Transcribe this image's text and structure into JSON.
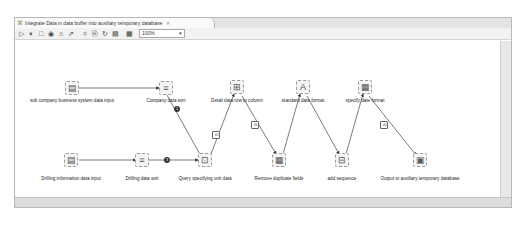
{
  "editor": {
    "tab_title": "Integrate Data in  data buffer into auxiliary temporary database",
    "tab_icon": "job-icon",
    "tab_close": "✕"
  },
  "toolbar": {
    "buttons": [
      {
        "name": "run-icon",
        "glyph": "▷"
      },
      {
        "name": "pause-icon",
        "glyph": "⏸"
      },
      {
        "name": "stop-icon",
        "glyph": "□"
      },
      {
        "name": "preview-icon",
        "glyph": "◉"
      },
      {
        "name": "lock-icon",
        "glyph": "⌂"
      },
      {
        "name": "export-icon",
        "glyph": "⇗"
      },
      {
        "name": "align-icon",
        "glyph": "⌗"
      },
      {
        "name": "copy-icon",
        "glyph": "⎘"
      },
      {
        "name": "refresh-icon",
        "glyph": "↻"
      },
      {
        "name": "layout-icon",
        "glyph": "▤"
      },
      {
        "name": "grid-icon",
        "glyph": "▦"
      }
    ],
    "zoom_value": "100%"
  },
  "nodes": [
    {
      "id": "n1",
      "label": "sub company business system data  input",
      "glyph": "▤"
    },
    {
      "id": "n2",
      "label": "Company data sort",
      "glyph": "≡"
    },
    {
      "id": "n3",
      "label": "Detail data row to column",
      "glyph": "⊞"
    },
    {
      "id": "n4",
      "label": "standard data format",
      "glyph": "A"
    },
    {
      "id": "n5",
      "label": "specify date format",
      "glyph": "▦"
    },
    {
      "id": "n6",
      "label": "Drilling information data input",
      "glyph": "▤"
    },
    {
      "id": "n7",
      "label": "Drilling data sort",
      "glyph": "≡"
    },
    {
      "id": "n8",
      "label": "Query specifying unit data",
      "glyph": "⊡"
    },
    {
      "id": "n9",
      "label": "Remove duplicate fields",
      "glyph": "▦"
    },
    {
      "id": "n10",
      "label": "add sequence",
      "glyph": "⊟"
    },
    {
      "id": "n11",
      "label": "Output to auxiliary temporary database",
      "glyph": "▣"
    }
  ],
  "connectors": {
    "badge_1": "1",
    "badge_2": "3"
  }
}
